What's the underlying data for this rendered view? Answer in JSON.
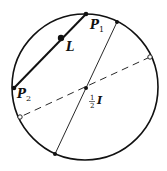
{
  "diagram": {
    "circle": {
      "cx": 85,
      "cy": 87,
      "r": 73,
      "stroke": "#111111"
    },
    "chord_P1P2": {
      "x1": 86,
      "y1": 14,
      "x2": 14,
      "y2": 88
    },
    "solid_diameter": {
      "x1": 117,
      "y1": 22,
      "x2": 55,
      "y2": 154
    },
    "dashed_diameter": {
      "x1": 150,
      "y1": 57,
      "x2": 20,
      "y2": 117
    },
    "points": {
      "P1": {
        "x": 86,
        "y": 14
      },
      "P2": {
        "x": 14,
        "y": 88
      },
      "L": {
        "x": 61,
        "y": 38
      },
      "center": {
        "x": 86,
        "y": 88
      },
      "top_end": {
        "x": 117,
        "y": 22
      },
      "bottom_end": {
        "x": 55,
        "y": 154
      },
      "open_right": {
        "x": 150,
        "y": 57
      },
      "open_left": {
        "x": 20,
        "y": 117
      }
    },
    "labels": {
      "P1_letter": "P",
      "P1_sub": "1",
      "P2_letter": "P",
      "P2_sub": "2",
      "L": "L",
      "half_num": "1",
      "half_den": "2",
      "I": "I"
    }
  }
}
